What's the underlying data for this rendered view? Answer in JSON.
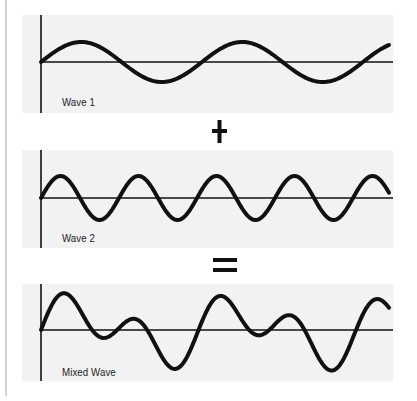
{
  "diagram": {
    "panels": [
      {
        "id": "wave1",
        "label": "Wave 1",
        "top": 15,
        "height": 98,
        "baseline": 62,
        "components": [
          {
            "amp": 20,
            "period": 161,
            "phase": 0
          }
        ]
      },
      {
        "id": "wave2",
        "label": "Wave 2",
        "top": 150,
        "height": 98,
        "baseline": 198,
        "components": [
          {
            "amp": 22,
            "period": 78,
            "phase": 0
          }
        ]
      },
      {
        "id": "mixed",
        "label": "Mixed Wave",
        "top": 284,
        "height": 97,
        "baseline": 330,
        "components": [
          {
            "amp": 20,
            "period": 161,
            "phase": 0
          },
          {
            "amp": 22,
            "period": 78,
            "phase": 0
          }
        ]
      }
    ],
    "operators": [
      {
        "id": "plus",
        "symbol": "+"
      },
      {
        "id": "equals",
        "symbol": "="
      }
    ],
    "colors": {
      "panel_bg": "#f2f2f2",
      "line": "#111111",
      "edge": "#d4d4d4"
    },
    "axis": {
      "x_start": 41,
      "x_end": 393,
      "panel_left": 22,
      "panel_right": 393
    }
  }
}
